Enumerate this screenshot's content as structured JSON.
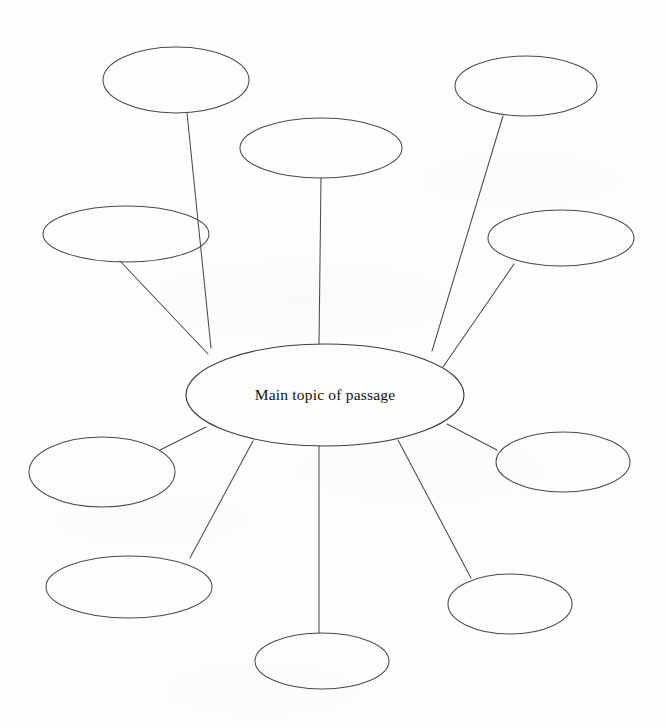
{
  "document": {
    "title": "Spider map graphic organizer",
    "background_color": "#fdfdfc",
    "stroke_color": "#4a4a4a",
    "text_color": "#111111"
  },
  "diagram": {
    "type": "spider-map",
    "central_node": {
      "id": "central",
      "label": "Main topic of passage",
      "cx": 325,
      "cy": 395,
      "rx": 139,
      "ry": 51
    },
    "satellite_nodes": [
      {
        "id": "node-top-left",
        "label": "",
        "cx": 176,
        "cy": 80,
        "rx": 73,
        "ry": 33
      },
      {
        "id": "node-top-center",
        "label": "",
        "cx": 321,
        "cy": 148,
        "rx": 81,
        "ry": 30
      },
      {
        "id": "node-top-right",
        "label": "",
        "cx": 526,
        "cy": 86,
        "rx": 71,
        "ry": 30
      },
      {
        "id": "node-left-upper",
        "label": "",
        "cx": 126,
        "cy": 234,
        "rx": 83,
        "ry": 28
      },
      {
        "id": "node-right-upper",
        "label": "",
        "cx": 561,
        "cy": 238,
        "rx": 73,
        "ry": 28
      },
      {
        "id": "node-left-middle",
        "label": "",
        "cx": 102,
        "cy": 472,
        "rx": 73,
        "ry": 35
      },
      {
        "id": "node-right-middle",
        "label": "",
        "cx": 563,
        "cy": 462,
        "rx": 67,
        "ry": 30
      },
      {
        "id": "node-left-lower",
        "label": "",
        "cx": 129,
        "cy": 587,
        "rx": 83,
        "ry": 31
      },
      {
        "id": "node-right-lower",
        "label": "",
        "cx": 510,
        "cy": 604,
        "rx": 62,
        "ry": 30
      },
      {
        "id": "node-bottom-center",
        "label": "",
        "cx": 322,
        "cy": 661,
        "rx": 67,
        "ry": 28
      }
    ],
    "connectors": [
      {
        "id": "connector-top-left",
        "from": "central",
        "to": "node-top-left",
        "x1": 211,
        "y1": 348,
        "x2": 187,
        "y2": 113
      },
      {
        "id": "connector-top-center",
        "from": "central",
        "to": "node-top-center",
        "x1": 319,
        "y1": 344,
        "x2": 321,
        "y2": 178
      },
      {
        "id": "connector-top-right",
        "from": "central",
        "to": "node-top-right",
        "x1": 432,
        "y1": 351,
        "x2": 503,
        "y2": 116
      },
      {
        "id": "connector-left-upper",
        "from": "central",
        "to": "node-left-upper",
        "x1": 208,
        "y1": 354,
        "x2": 120,
        "y2": 261
      },
      {
        "id": "connector-right-upper",
        "from": "central",
        "to": "node-right-upper",
        "x1": 443,
        "y1": 367,
        "x2": 514,
        "y2": 264
      },
      {
        "id": "connector-left-middle",
        "from": "central",
        "to": "node-left-middle",
        "x1": 206,
        "y1": 427,
        "x2": 160,
        "y2": 450
      },
      {
        "id": "connector-right-middle",
        "from": "central",
        "to": "node-right-middle",
        "x1": 447,
        "y1": 424,
        "x2": 497,
        "y2": 450
      },
      {
        "id": "connector-left-lower",
        "from": "central",
        "to": "node-left-lower",
        "x1": 253,
        "y1": 441,
        "x2": 190,
        "y2": 558
      },
      {
        "id": "connector-right-lower",
        "from": "central",
        "to": "node-right-lower",
        "x1": 398,
        "y1": 440,
        "x2": 471,
        "y2": 578
      },
      {
        "id": "connector-bottom-center",
        "from": "central",
        "to": "node-bottom-center",
        "x1": 319,
        "y1": 446,
        "x2": 319,
        "y2": 633
      }
    ]
  }
}
